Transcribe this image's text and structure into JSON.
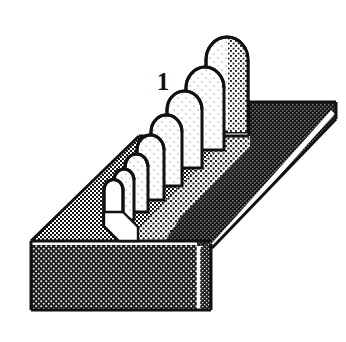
{
  "figure": {
    "type": "technical-line-drawing",
    "view": "isometric-perspective",
    "background_color": "#ffffff",
    "line_color": "#111111",
    "highlight_color": "#ffffff",
    "labels": [
      {
        "id": "reference-numeral-1",
        "text": "1",
        "x": 163,
        "y": 84,
        "font_size": 25,
        "bold": true,
        "color": "#101010"
      }
    ],
    "tones": {
      "front_face": {
        "name": "front-face-dark-halftone",
        "base_color": "#1a1a1a",
        "dot_color": "#f2f2f2",
        "density": "dark",
        "cell": 5
      },
      "right_face": {
        "name": "right-face-dark-halftone",
        "base_color": "#202020",
        "dot_color": "#e8e8e8",
        "density": "dark",
        "cell": 4
      },
      "right_band": {
        "name": "right-band-dark-halftone",
        "base_color": "#161616",
        "dot_color": "#dcdcdc",
        "density": "dark",
        "cell": 4
      },
      "top_face": {
        "name": "top-face-mid-halftone",
        "base_color": "#ffffff",
        "dot_color": "#141414",
        "density": "medium",
        "cell": 4
      },
      "arch_face": {
        "name": "arch-face-light-stipple",
        "base_color": "#ffffff",
        "dot_color": "#303030",
        "density": "light",
        "cell": 5
      },
      "groove": {
        "name": "groove-white",
        "base_color": "#ffffff",
        "density": "none"
      }
    },
    "block": {
      "name": "rectangular-slab",
      "top_face_polygon": "31,241 139,136 249,136 249,102 336,102 211,227 211,241",
      "front_face_polygon": "31,241 31,310 197,310 197,248 211,248 211,241",
      "right_face_polygon": "211,241 211,310 197,310 197,248",
      "outline_points": "31,241 139,136 249,136 249,102 336,102 336,119 211,248 211,310 197,310 31,310",
      "white_edge_lines": [
        {
          "name": "top-front-edge-highlight",
          "x1": 31,
          "y1": 243,
          "x2": 197,
          "y2": 243
        },
        {
          "name": "right-diagonal-highlight",
          "x1": 211,
          "y1": 246,
          "x2": 332,
          "y2": 113
        },
        {
          "name": "right-vertical-highlight",
          "x1": 198,
          "y1": 249,
          "x2": 198,
          "y2": 309
        }
      ]
    },
    "corrugations": {
      "name": "nested-arch-ridge-row",
      "count": 8,
      "description": "Row of nested semicircular arch ribs receding in perspective along the top surface",
      "arches": [
        {
          "index": 1,
          "cx": 113,
          "cy": 178,
          "rx": 10,
          "ry": 10,
          "height": 36,
          "depth": 0
        },
        {
          "index": 2,
          "cx": 124,
          "cy": 165,
          "rx": 13,
          "ry": 13,
          "height": 42,
          "depth": 1
        },
        {
          "index": 3,
          "cx": 137,
          "cy": 150,
          "rx": 16,
          "ry": 16,
          "height": 48,
          "depth": 2
        },
        {
          "index": 4,
          "cx": 152,
          "cy": 133,
          "rx": 19,
          "ry": 19,
          "height": 54,
          "depth": 3
        },
        {
          "index": 5,
          "cx": 168,
          "cy": 114,
          "rx": 22,
          "ry": 22,
          "height": 60,
          "depth": 4
        },
        {
          "index": 6,
          "cx": 186,
          "cy": 93,
          "rx": 25,
          "ry": 25,
          "height": 66,
          "depth": 5
        },
        {
          "index": 7,
          "cx": 205,
          "cy": 70,
          "rx": 28,
          "ry": 28,
          "height": 72,
          "depth": 6
        },
        {
          "index": 8,
          "cx": 226,
          "cy": 54,
          "rx": 22,
          "ry": 22,
          "height": 82,
          "depth": 7
        }
      ],
      "groove_polygon": "104,222 104,180 113,170 122,180 122,168 140,150 154,150 140,168 140,214"
    }
  }
}
